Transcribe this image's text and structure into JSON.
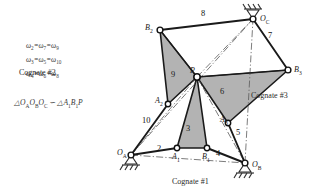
{
  "figure": {
    "type": "mechanism-diagram",
    "colors": {
      "link": "#1a1a1a",
      "shading": "#b3b3b3",
      "ground": "#2b2b2b",
      "centerline": "#555555",
      "text": "#2b2b2b"
    }
  },
  "equations": [
    {
      "lhs": "ω",
      "lsub": "2",
      "m1": "ω",
      "msub": "7",
      "r": "ω",
      "rsub": "9"
    },
    {
      "lhs": "ω",
      "lsub": "3",
      "m1": "ω",
      "msub": "5",
      "r": "ω",
      "rsub": "10"
    },
    {
      "lhs": "ω",
      "lsub": "4",
      "m1": "ω",
      "msub": "6",
      "r": "ω",
      "rsub": "8"
    }
  ],
  "similarity": {
    "tri": "△",
    "left_o": "O",
    "left_a": "A",
    "left_b": "B",
    "left_c": "C",
    "sim": "∽",
    "right_a": "A",
    "right_a_sub": "1",
    "right_b": "B",
    "right_b_sub": "1",
    "right_p": "P"
  },
  "cognates": [
    {
      "id": "cognate-1",
      "label": "Cognate #1"
    },
    {
      "id": "cognate-2",
      "label": "Cognate #2"
    },
    {
      "id": "cognate-3",
      "label": "Cognate #3"
    }
  ],
  "joints": [
    {
      "id": "OA",
      "base": "O",
      "sub": "A",
      "x": 131,
      "y": 155,
      "ground": true
    },
    {
      "id": "OB",
      "base": "O",
      "sub": "B",
      "x": 245,
      "y": 163,
      "ground": true
    },
    {
      "id": "OC",
      "base": "O",
      "sub": "C",
      "x": 253,
      "y": 19,
      "ground": true
    },
    {
      "id": "A1",
      "base": "A",
      "sub": "1",
      "x": 177,
      "y": 148,
      "ground": false
    },
    {
      "id": "B1",
      "base": "B",
      "sub": "1",
      "x": 207,
      "y": 148,
      "ground": false
    },
    {
      "id": "A2",
      "base": "A",
      "sub": "2",
      "x": 168,
      "y": 104,
      "ground": false
    },
    {
      "id": "B2",
      "base": "B",
      "sub": "2",
      "x": 160,
      "y": 30,
      "ground": false
    },
    {
      "id": "A3",
      "base": "A",
      "sub": "3",
      "x": 228,
      "y": 123,
      "ground": false
    },
    {
      "id": "B3",
      "base": "B",
      "sub": "3",
      "x": 288,
      "y": 70,
      "ground": false
    },
    {
      "id": "P",
      "base": "P",
      "sub": "",
      "x": 197,
      "y": 77,
      "ground": false
    }
  ],
  "link_numbers": [
    {
      "id": "link-2",
      "label": "2",
      "x": 160,
      "y": 150
    },
    {
      "id": "link-3",
      "label": "3",
      "x": 189,
      "y": 130
    },
    {
      "id": "link-4",
      "label": "4",
      "x": 219,
      "y": 155
    },
    {
      "id": "link-5",
      "label": "5",
      "x": 239,
      "y": 134
    },
    {
      "id": "link-6",
      "label": "6",
      "x": 223,
      "y": 93
    },
    {
      "id": "link-7",
      "label": "7",
      "x": 271,
      "y": 37
    },
    {
      "id": "link-8",
      "label": "8",
      "x": 204,
      "y": 15
    },
    {
      "id": "link-9",
      "label": "9",
      "x": 174,
      "y": 76
    },
    {
      "id": "link-10",
      "label": "10",
      "x": 146,
      "y": 122
    }
  ]
}
